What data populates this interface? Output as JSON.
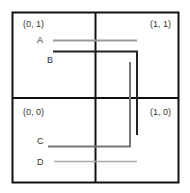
{
  "quadrants": {
    "top_left": "(0, 1)",
    "top_right": "(1, 1)",
    "bottom_left": "(0, 0)",
    "bottom_right": "(1, 0)"
  },
  "paths": {
    "A": {
      "label": "A",
      "color": "#9a9a9a"
    },
    "B": {
      "label": "B",
      "color": "#222222"
    },
    "C": {
      "label": "C",
      "color": "#777777"
    },
    "D": {
      "label": "D",
      "color": "#aaaaaa"
    }
  },
  "colors": {
    "grid": "#111111",
    "background": "#ffffff"
  }
}
